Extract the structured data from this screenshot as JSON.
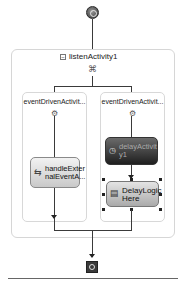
{
  "workflow": {
    "start_icon": "workflow-start-icon",
    "end_icon": "workflow-stop-icon",
    "listen": {
      "title": "listenActivity1",
      "collapse_glyph": "−",
      "icon": "listen-activity-icon",
      "icon_glyph": "⌘"
    },
    "branches": [
      {
        "title": "eventDrivenActivit...",
        "icon_glyph": "⚙",
        "activities": [
          {
            "label_line1": "handleExter",
            "label_line2": "nalEventA...",
            "icon_glyph": "⇆",
            "style": "light"
          }
        ]
      },
      {
        "title": "eventDrivenActivit...",
        "icon_glyph": "⚙",
        "activities": [
          {
            "label_line1": "delayActivit",
            "label_line2": "y1",
            "icon_glyph": "◷",
            "style": "dark"
          },
          {
            "label_line1": "DelayLogic",
            "label_line2": "Here",
            "icon_glyph": "▤",
            "style": "selected"
          }
        ]
      }
    ]
  }
}
